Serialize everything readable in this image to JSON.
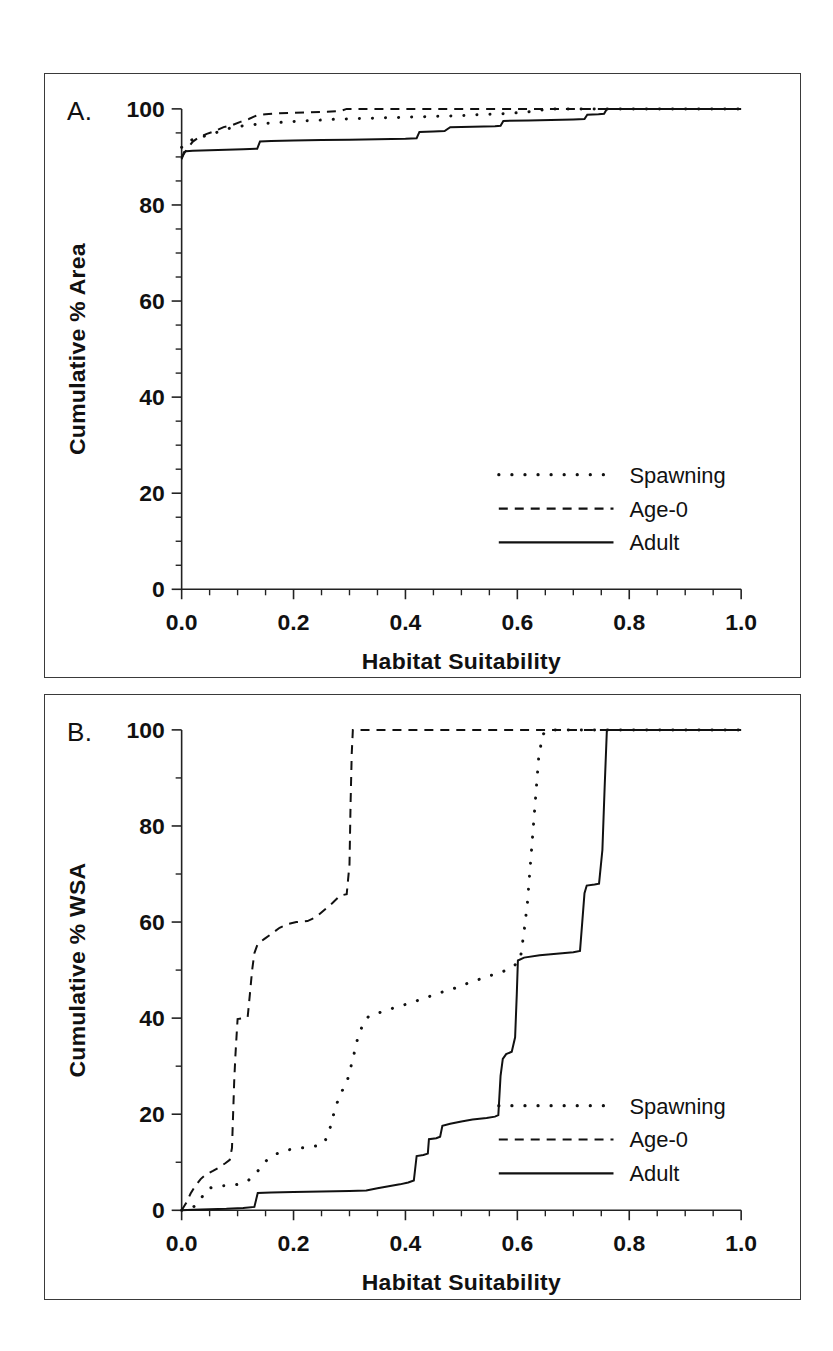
{
  "figure": {
    "panels": [
      {
        "letter": "A."
      },
      {
        "letter": "B."
      }
    ]
  },
  "chart_data": [
    {
      "panel": "A",
      "type": "line",
      "title": "",
      "xlabel": "Habitat Suitability",
      "ylabel": "Cumulative % Area",
      "xlim": [
        0.0,
        1.0
      ],
      "ylim": [
        0,
        100
      ],
      "xticks": [
        0.0,
        0.2,
        0.4,
        0.6,
        0.8,
        1.0
      ],
      "xticklabels": [
        "0.0",
        "0.2",
        "0.4",
        "0.6",
        "0.8",
        "1.0"
      ],
      "xminor_step": 0.05,
      "yticks": [
        0,
        20,
        40,
        60,
        80,
        100
      ],
      "yticklabels": [
        "0",
        "20",
        "40",
        "60",
        "80",
        "100"
      ],
      "yminor_step": 5,
      "grid": false,
      "legend_position": "lower-right",
      "series": [
        {
          "name": "Spawning",
          "style": "dotted",
          "points": [
            [
              0.0,
              92.0
            ],
            [
              0.01,
              93.3
            ],
            [
              0.02,
              93.6
            ],
            [
              0.03,
              93.9
            ],
            [
              0.045,
              94.5
            ],
            [
              0.06,
              95.0
            ],
            [
              0.075,
              95.6
            ],
            [
              0.09,
              96.1
            ],
            [
              0.105,
              96.4
            ],
            [
              0.12,
              96.6
            ],
            [
              0.14,
              96.9
            ],
            [
              0.165,
              97.1
            ],
            [
              0.19,
              97.3
            ],
            [
              0.215,
              97.5
            ],
            [
              0.24,
              97.6
            ],
            [
              0.265,
              97.8
            ],
            [
              0.29,
              97.9
            ],
            [
              0.32,
              98.0
            ],
            [
              0.35,
              98.1
            ],
            [
              0.38,
              98.2
            ],
            [
              0.41,
              98.3
            ],
            [
              0.44,
              98.4
            ],
            [
              0.47,
              98.5
            ],
            [
              0.5,
              98.6
            ],
            [
              0.53,
              98.8
            ],
            [
              0.56,
              98.9
            ],
            [
              0.59,
              99.1
            ],
            [
              0.62,
              99.4
            ],
            [
              0.645,
              99.8
            ],
            [
              0.66,
              100.0
            ],
            [
              1.0,
              100.0
            ]
          ]
        },
        {
          "name": "Age-0",
          "style": "dashed",
          "points": [
            [
              0.0,
              89.8
            ],
            [
              0.006,
              91.0
            ],
            [
              0.012,
              92.0
            ],
            [
              0.02,
              93.2
            ],
            [
              0.03,
              94.0
            ],
            [
              0.045,
              94.8
            ],
            [
              0.06,
              95.4
            ],
            [
              0.075,
              96.2
            ],
            [
              0.09,
              96.6
            ],
            [
              0.105,
              97.3
            ],
            [
              0.12,
              97.9
            ],
            [
              0.135,
              98.7
            ],
            [
              0.15,
              98.9
            ],
            [
              0.175,
              99.1
            ],
            [
              0.2,
              99.2
            ],
            [
              0.23,
              99.3
            ],
            [
              0.26,
              99.4
            ],
            [
              0.285,
              99.6
            ],
            [
              0.295,
              100.0
            ],
            [
              1.0,
              100.0
            ]
          ]
        },
        {
          "name": "Adult",
          "style": "solid",
          "points": [
            [
              0.0,
              89.5
            ],
            [
              0.004,
              91.0
            ],
            [
              0.008,
              91.2
            ],
            [
              0.02,
              91.3
            ],
            [
              0.05,
              91.4
            ],
            [
              0.08,
              91.5
            ],
            [
              0.11,
              91.6
            ],
            [
              0.135,
              91.7
            ],
            [
              0.14,
              93.2
            ],
            [
              0.16,
              93.3
            ],
            [
              0.2,
              93.4
            ],
            [
              0.25,
              93.5
            ],
            [
              0.3,
              93.6
            ],
            [
              0.35,
              93.7
            ],
            [
              0.4,
              93.8
            ],
            [
              0.42,
              93.9
            ],
            [
              0.425,
              95.2
            ],
            [
              0.45,
              95.3
            ],
            [
              0.47,
              95.4
            ],
            [
              0.48,
              96.2
            ],
            [
              0.52,
              96.3
            ],
            [
              0.56,
              96.4
            ],
            [
              0.57,
              96.5
            ],
            [
              0.575,
              97.5
            ],
            [
              0.62,
              97.6
            ],
            [
              0.66,
              97.7
            ],
            [
              0.7,
              97.8
            ],
            [
              0.72,
              97.9
            ],
            [
              0.725,
              98.8
            ],
            [
              0.745,
              98.9
            ],
            [
              0.755,
              99.0
            ],
            [
              0.76,
              100.0
            ],
            [
              1.0,
              100.0
            ]
          ]
        }
      ]
    },
    {
      "panel": "B",
      "type": "line",
      "title": "",
      "xlabel": "Habitat Suitability",
      "ylabel": "Cumulative % WSA",
      "xlim": [
        0.0,
        1.0
      ],
      "ylim": [
        0,
        100
      ],
      "xticks": [
        0.0,
        0.2,
        0.4,
        0.6,
        0.8,
        1.0
      ],
      "xticklabels": [
        "0.0",
        "0.2",
        "0.4",
        "0.6",
        "0.8",
        "1.0"
      ],
      "xminor_step": 0.05,
      "yticks": [
        0,
        20,
        40,
        60,
        80,
        100
      ],
      "yticklabels": [
        "0",
        "20",
        "40",
        "60",
        "80",
        "100"
      ],
      "yminor_step": 10,
      "grid": false,
      "legend_position": "middle-right",
      "series": [
        {
          "name": "Spawning",
          "style": "dotted",
          "points": [
            [
              0.0,
              0.0
            ],
            [
              0.015,
              0.3
            ],
            [
              0.025,
              1.0
            ],
            [
              0.035,
              2.5
            ],
            [
              0.045,
              4.4
            ],
            [
              0.06,
              5.0
            ],
            [
              0.075,
              5.1
            ],
            [
              0.09,
              5.2
            ],
            [
              0.105,
              5.5
            ],
            [
              0.12,
              6.3
            ],
            [
              0.135,
              8.0
            ],
            [
              0.15,
              10.2
            ],
            [
              0.165,
              11.5
            ],
            [
              0.18,
              12.3
            ],
            [
              0.2,
              12.8
            ],
            [
              0.215,
              13.0
            ],
            [
              0.23,
              13.2
            ],
            [
              0.245,
              13.5
            ],
            [
              0.255,
              14.0
            ],
            [
              0.265,
              17.0
            ],
            [
              0.275,
              21.5
            ],
            [
              0.285,
              24.5
            ],
            [
              0.295,
              26.5
            ],
            [
              0.305,
              31.0
            ],
            [
              0.315,
              36.0
            ],
            [
              0.325,
              39.0
            ],
            [
              0.335,
              40.5
            ],
            [
              0.35,
              41.0
            ],
            [
              0.37,
              41.8
            ],
            [
              0.39,
              42.5
            ],
            [
              0.41,
              43.2
            ],
            [
              0.43,
              44.0
            ],
            [
              0.45,
              44.8
            ],
            [
              0.47,
              45.6
            ],
            [
              0.49,
              46.3
            ],
            [
              0.51,
              47.2
            ],
            [
              0.53,
              48.0
            ],
            [
              0.55,
              48.8
            ],
            [
              0.57,
              49.5
            ],
            [
              0.59,
              50.5
            ],
            [
              0.605,
              52.0
            ],
            [
              0.612,
              58.0
            ],
            [
              0.618,
              64.0
            ],
            [
              0.622,
              70.0
            ],
            [
              0.626,
              76.0
            ],
            [
              0.63,
              82.0
            ],
            [
              0.634,
              88.0
            ],
            [
              0.638,
              94.0
            ],
            [
              0.645,
              99.0
            ],
            [
              0.655,
              100.0
            ],
            [
              1.0,
              100.0
            ]
          ]
        },
        {
          "name": "Age-0",
          "style": "dashed",
          "points": [
            [
              0.0,
              0.0
            ],
            [
              0.008,
              1.5
            ],
            [
              0.016,
              3.5
            ],
            [
              0.024,
              5.0
            ],
            [
              0.034,
              6.5
            ],
            [
              0.044,
              7.5
            ],
            [
              0.056,
              8.2
            ],
            [
              0.068,
              9.0
            ],
            [
              0.078,
              9.8
            ],
            [
              0.086,
              10.5
            ],
            [
              0.09,
              13.0
            ],
            [
              0.092,
              20.0
            ],
            [
              0.094,
              27.0
            ],
            [
              0.096,
              32.0
            ],
            [
              0.098,
              36.0
            ],
            [
              0.1,
              39.8
            ],
            [
              0.112,
              40.0
            ],
            [
              0.118,
              40.2
            ],
            [
              0.122,
              45.0
            ],
            [
              0.126,
              50.0
            ],
            [
              0.13,
              53.5
            ],
            [
              0.136,
              55.5
            ],
            [
              0.148,
              56.5
            ],
            [
              0.16,
              57.5
            ],
            [
              0.175,
              58.8
            ],
            [
              0.19,
              59.6
            ],
            [
              0.205,
              60.0
            ],
            [
              0.225,
              60.2
            ],
            [
              0.24,
              61.0
            ],
            [
              0.255,
              62.5
            ],
            [
              0.27,
              64.0
            ],
            [
              0.283,
              65.5
            ],
            [
              0.295,
              65.8
            ],
            [
              0.3,
              72.0
            ],
            [
              0.302,
              85.0
            ],
            [
              0.304,
              95.0
            ],
            [
              0.306,
              100.0
            ],
            [
              1.0,
              100.0
            ]
          ]
        },
        {
          "name": "Adult",
          "style": "solid",
          "points": [
            [
              0.0,
              0.0
            ],
            [
              0.02,
              0.1
            ],
            [
              0.05,
              0.2
            ],
            [
              0.08,
              0.3
            ],
            [
              0.11,
              0.5
            ],
            [
              0.13,
              0.7
            ],
            [
              0.136,
              3.6
            ],
            [
              0.16,
              3.7
            ],
            [
              0.2,
              3.8
            ],
            [
              0.25,
              3.9
            ],
            [
              0.3,
              4.0
            ],
            [
              0.33,
              4.1
            ],
            [
              0.35,
              4.6
            ],
            [
              0.37,
              5.0
            ],
            [
              0.39,
              5.4
            ],
            [
              0.405,
              5.8
            ],
            [
              0.415,
              6.2
            ],
            [
              0.42,
              11.3
            ],
            [
              0.432,
              11.5
            ],
            [
              0.44,
              11.8
            ],
            [
              0.442,
              14.8
            ],
            [
              0.455,
              15.0
            ],
            [
              0.462,
              15.3
            ],
            [
              0.466,
              17.6
            ],
            [
              0.48,
              18.0
            ],
            [
              0.5,
              18.5
            ],
            [
              0.52,
              18.9
            ],
            [
              0.545,
              19.2
            ],
            [
              0.56,
              19.5
            ],
            [
              0.566,
              19.8
            ],
            [
              0.57,
              28.0
            ],
            [
              0.574,
              31.5
            ],
            [
              0.58,
              32.5
            ],
            [
              0.59,
              33.0
            ],
            [
              0.596,
              36.0
            ],
            [
              0.599,
              45.0
            ],
            [
              0.601,
              52.0
            ],
            [
              0.612,
              52.6
            ],
            [
              0.64,
              53.1
            ],
            [
              0.67,
              53.4
            ],
            [
              0.7,
              53.7
            ],
            [
              0.712,
              54.0
            ],
            [
              0.716,
              60.0
            ],
            [
              0.72,
              66.0
            ],
            [
              0.724,
              67.6
            ],
            [
              0.738,
              67.8
            ],
            [
              0.746,
              68.0
            ],
            [
              0.752,
              75.0
            ],
            [
              0.756,
              88.0
            ],
            [
              0.76,
              100.0
            ],
            [
              1.0,
              100.0
            ]
          ]
        }
      ]
    }
  ],
  "legend": {
    "entries": [
      {
        "label": "Spawning",
        "style": "dotted"
      },
      {
        "label": "Age-0",
        "style": "dashed"
      },
      {
        "label": "Adult",
        "style": "solid"
      }
    ]
  }
}
